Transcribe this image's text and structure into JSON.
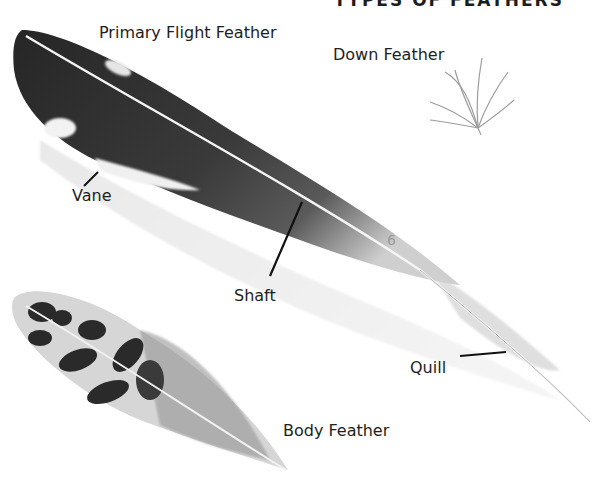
{
  "title": "TYPES OF FEATHERS",
  "labels": {
    "primary": "Primary Flight Feather",
    "down": "Down Feather",
    "vane": "Vane",
    "shaft": "Shaft",
    "quill": "Quill",
    "body": "Body Feather",
    "number": "6"
  },
  "colors": {
    "ink": "#1e1e1e",
    "feather_dark": "#2a2a2a",
    "feather_mid": "#6a6a6a",
    "feather_light": "#d8d8d8",
    "background": "#ffffff"
  }
}
